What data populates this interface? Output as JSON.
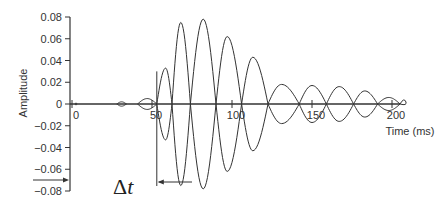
{
  "chart_data": {
    "type": "line",
    "title": "",
    "xlabel": "Time (ms)",
    "ylabel": "Amplitude",
    "xlim": [
      0,
      205
    ],
    "ylim": [
      -0.08,
      0.08
    ],
    "x_ticks": [
      0,
      50,
      100,
      150,
      200
    ],
    "x_tick_labels": [
      "0",
      "50",
      "100",
      "150",
      "200"
    ],
    "y_ticks": [
      0.08,
      0.06,
      0.04,
      0.02,
      0,
      -0.02,
      -0.04,
      -0.06,
      -0.08
    ],
    "y_tick_labels": [
      "0.08",
      "0.06",
      "0.04",
      "0.02",
      "0",
      "−0.02",
      "−0.04",
      "−0.06",
      "−0.08"
    ],
    "grid": false,
    "legend": null,
    "lobes": [
      {
        "start_ms": 2,
        "end_ms": 3,
        "peak_ms": 2.5,
        "amplitude": 0.001
      },
      {
        "start_ms": 28,
        "end_ms": 34,
        "peak_ms": 31,
        "amplitude": 0.002
      },
      {
        "start_ms": 41,
        "end_ms": 53,
        "peak_ms": 47,
        "amplitude": 0.005
      },
      {
        "start_ms": 53,
        "end_ms": 62.5,
        "peak_ms": 58.5,
        "amplitude": 0.033
      },
      {
        "start_ms": 62.5,
        "end_ms": 74,
        "peak_ms": 68,
        "amplitude": 0.075
      },
      {
        "start_ms": 74,
        "end_ms": 90,
        "peak_ms": 82,
        "amplitude": 0.078
      },
      {
        "start_ms": 90,
        "end_ms": 106,
        "peak_ms": 97,
        "amplitude": 0.062
      },
      {
        "start_ms": 106,
        "end_ms": 122.5,
        "peak_ms": 113,
        "amplitude": 0.043
      },
      {
        "start_ms": 122.5,
        "end_ms": 142,
        "peak_ms": 131,
        "amplitude": 0.018
      },
      {
        "start_ms": 142,
        "end_ms": 159,
        "peak_ms": 150,
        "amplitude": 0.017
      },
      {
        "start_ms": 159,
        "end_ms": 176,
        "peak_ms": 167,
        "amplitude": 0.016
      },
      {
        "start_ms": 176,
        "end_ms": 191,
        "peak_ms": 183,
        "amplitude": 0.012
      },
      {
        "start_ms": 191,
        "end_ms": 205,
        "peak_ms": 198,
        "amplitude": 0.006
      }
    ],
    "annotations": [
      {
        "type": "label",
        "text": "Δt",
        "note": "Delay between time 0 and onset of main burst (~53 ms)"
      },
      {
        "type": "arrow",
        "from_ms": 75,
        "to_ms": 53,
        "y": -0.075,
        "note": "Leftward arrow marking onset of burst"
      },
      {
        "type": "vertical_line",
        "x_ms": 53,
        "y_from": 0.03,
        "y_to": -0.075
      },
      {
        "type": "arrow",
        "note": "Arrow pointing into y-axis at about -0.07"
      }
    ]
  },
  "labels": {
    "xlabel": "Time (ms)",
    "ylabel": "Amplitude",
    "delta_symbol": "Δ",
    "delta_var": "t"
  }
}
